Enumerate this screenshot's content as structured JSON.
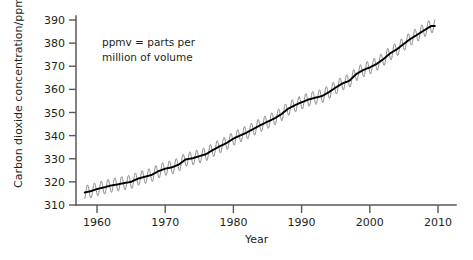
{
  "chart_data": {
    "type": "line",
    "title": "",
    "xlabel": "Year",
    "ylabel": "Carbon dioxide concentration/ppmv",
    "xlim": [
      1956,
      2012
    ],
    "ylim": [
      310,
      390
    ],
    "grid": false,
    "legend": "none",
    "annotation": {
      "line1": "ppmv = parts per",
      "line2": "million of volume"
    },
    "xticks": [
      1960,
      1970,
      1980,
      1990,
      2000,
      2010
    ],
    "xtick_labels": [
      "1960",
      "1970",
      "1980",
      "1990",
      "2000",
      "2010"
    ],
    "yticks": [
      310,
      320,
      330,
      340,
      350,
      360,
      370,
      380,
      390
    ],
    "ytick_labels": [
      "310",
      "320",
      "330",
      "340",
      "350",
      "360",
      "370",
      "380",
      "390"
    ],
    "seasonal_amplitude_ppmv": 3.0,
    "series": [
      {
        "name": "Annual mean trend",
        "color": "#000000",
        "x": [
          1958,
          1959,
          1960,
          1961,
          1962,
          1963,
          1964,
          1965,
          1966,
          1967,
          1968,
          1969,
          1970,
          1971,
          1972,
          1973,
          1974,
          1975,
          1976,
          1977,
          1978,
          1979,
          1980,
          1981,
          1982,
          1983,
          1984,
          1985,
          1986,
          1987,
          1988,
          1989,
          1990,
          1991,
          1992,
          1993,
          1994,
          1995,
          1996,
          1997,
          1998,
          1999,
          2000,
          2001,
          2002,
          2003,
          2004,
          2005,
          2006,
          2007,
          2008,
          2009
        ],
        "values": [
          315.3,
          315.9,
          316.9,
          317.6,
          318.4,
          318.9,
          319.5,
          320.0,
          321.4,
          322.2,
          323.0,
          324.6,
          325.7,
          326.3,
          327.5,
          329.7,
          330.2,
          331.1,
          332.0,
          333.8,
          335.4,
          336.8,
          338.7,
          340.1,
          341.4,
          343.0,
          344.6,
          346.0,
          347.4,
          349.2,
          351.6,
          353.1,
          354.4,
          355.6,
          356.4,
          357.1,
          358.8,
          360.8,
          362.6,
          363.7,
          366.6,
          368.3,
          369.5,
          371.0,
          373.1,
          375.6,
          377.4,
          379.7,
          381.9,
          383.7,
          385.6,
          387.4
        ]
      },
      {
        "name": "Monthly observations (seasonal cycle)",
        "color": "#8b8b8d"
      }
    ]
  },
  "axes": {
    "y_axis_label": "Carbon dioxide concentration/ppmv",
    "x_axis_label": "Year"
  }
}
